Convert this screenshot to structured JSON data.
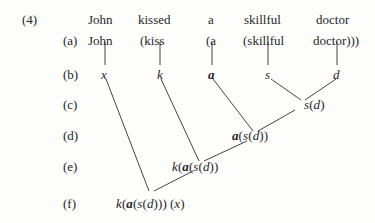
{
  "figure": {
    "number": "(4)",
    "background_color": "#fdfdfc",
    "ink_color": "#262626"
  },
  "row_labels": {
    "a": "(a)",
    "b": "(b)",
    "c": "(c)",
    "d": "(d)",
    "e": "(e)",
    "f": "(f)"
  },
  "sentence": {
    "words": [
      "John",
      "kissed",
      "a",
      "skillful",
      "doctor"
    ]
  },
  "row_a": {
    "tokens": [
      "John",
      "(kiss",
      "(a",
      "(skillful",
      "doctor)))"
    ]
  },
  "row_b": {
    "tokens": [
      "x",
      "k",
      "a",
      "s",
      "d"
    ],
    "bold_index": 2
  },
  "row_c": {
    "expression_plain": "s(d)",
    "parts": [
      {
        "text": "s",
        "style": "italic"
      },
      {
        "text": "(",
        "style": "roman"
      },
      {
        "text": "d",
        "style": "italic"
      },
      {
        "text": ")",
        "style": "roman"
      }
    ]
  },
  "row_d": {
    "expression_plain": "a(s(d))",
    "parts": [
      {
        "text": "a",
        "style": "bold-italic"
      },
      {
        "text": "(",
        "style": "roman"
      },
      {
        "text": "s",
        "style": "italic"
      },
      {
        "text": "(",
        "style": "roman"
      },
      {
        "text": "d",
        "style": "italic"
      },
      {
        "text": "))",
        "style": "roman"
      }
    ]
  },
  "row_e": {
    "expression_plain": "k(a(s(d))",
    "parts": [
      {
        "text": "k",
        "style": "italic"
      },
      {
        "text": "(",
        "style": "roman"
      },
      {
        "text": "a",
        "style": "bold-italic"
      },
      {
        "text": "(",
        "style": "roman"
      },
      {
        "text": "s",
        "style": "italic"
      },
      {
        "text": "(",
        "style": "roman"
      },
      {
        "text": "d",
        "style": "italic"
      },
      {
        "text": "))",
        "style": "roman"
      }
    ]
  },
  "row_f": {
    "expression_plain": "k(a(s(d))) (x)",
    "parts": [
      {
        "text": "k",
        "style": "italic"
      },
      {
        "text": "(",
        "style": "roman"
      },
      {
        "text": "a",
        "style": "bold-italic"
      },
      {
        "text": "(",
        "style": "roman"
      },
      {
        "text": "s",
        "style": "italic"
      },
      {
        "text": "(",
        "style": "roman"
      },
      {
        "text": "d",
        "style": "italic"
      },
      {
        "text": ")))",
        "style": "roman"
      },
      {
        "text": "(",
        "style": "roman"
      },
      {
        "text": "x",
        "style": "italic"
      },
      {
        "text": ")",
        "style": "roman"
      }
    ]
  }
}
